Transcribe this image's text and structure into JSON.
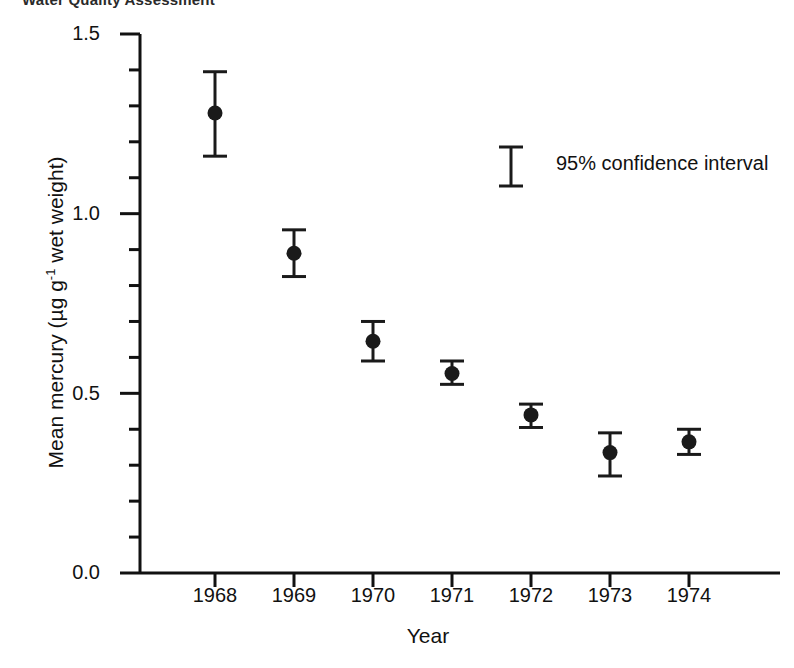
{
  "top_caption": "Water Quality Assessment",
  "chart_data": {
    "type": "scatter",
    "title": "",
    "xlabel": "Year",
    "ylabel": "Mean mercury  (µg g-1 wet weight)",
    "ylabel_main": "Mean mercury  (µg g",
    "ylabel_exponent": "-1",
    "ylabel_tail": " wet weight)",
    "x": [
      1968,
      1969,
      1970,
      1971,
      1972,
      1973,
      1974
    ],
    "categories": [
      "1968",
      "1969",
      "1970",
      "1971",
      "1972",
      "1973",
      "1974"
    ],
    "values": [
      1.28,
      0.89,
      0.645,
      0.555,
      0.44,
      0.335,
      0.365
    ],
    "err_low": [
      1.16,
      0.825,
      0.59,
      0.525,
      0.405,
      0.27,
      0.33
    ],
    "err_high": [
      1.395,
      0.955,
      0.7,
      0.59,
      0.47,
      0.39,
      0.4
    ],
    "series": [
      {
        "name": "Mean mercury",
        "points": [
          {
            "x": "1968",
            "y": 1.28,
            "low": 1.16,
            "high": 1.395
          },
          {
            "x": "1969",
            "y": 0.89,
            "low": 0.825,
            "high": 0.955
          },
          {
            "x": "1970",
            "y": 0.645,
            "low": 0.59,
            "high": 0.7
          },
          {
            "x": "1971",
            "y": 0.555,
            "low": 0.525,
            "high": 0.59
          },
          {
            "x": "1972",
            "y": 0.44,
            "low": 0.405,
            "high": 0.47
          },
          {
            "x": "1973",
            "y": 0.335,
            "low": 0.27,
            "high": 0.39
          },
          {
            "x": "1974",
            "y": 0.365,
            "low": 0.33,
            "high": 0.4
          }
        ]
      }
    ],
    "ylim": [
      0.0,
      1.5
    ],
    "ytick_labels": [
      "0.0",
      "0.5",
      "1.0",
      "1.5"
    ],
    "ytick_values": [
      0.0,
      0.5,
      1.0,
      1.5
    ],
    "yminor_step": 0.1,
    "xtick_labels": [
      "1968",
      "1969",
      "1970",
      "1971",
      "1972",
      "1973",
      "1974"
    ],
    "grid": false,
    "legend_position": "upper-right-inset",
    "legend_label": "95% confidence interval",
    "marker": "filled-circle",
    "marker_color": "#1a1a1a",
    "line_color": "#1a1a1a",
    "axis_color": "#111111",
    "background": "#ffffff"
  }
}
